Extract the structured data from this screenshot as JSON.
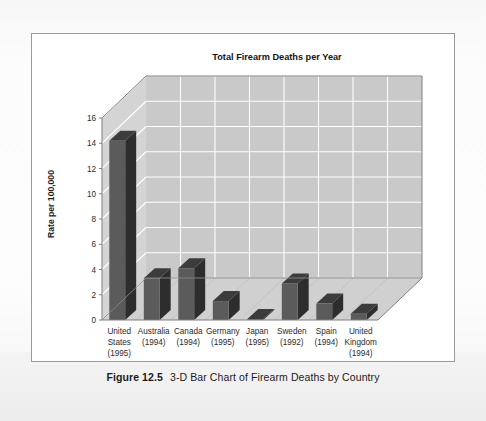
{
  "figure": {
    "caption_label": "Figure 12.5",
    "caption_text": "3-D Bar Chart of Firearm Deaths by Country"
  },
  "colors": {
    "page_background": "#fbfbfb",
    "figure_border": "#9a9a9a",
    "plot_back_wall": "#c9c9c9",
    "plot_side_wall": "#d4d4d4",
    "plot_floor": "#d0d0d0",
    "gridline": "#ffffff",
    "bar_front": "#5b5b5b",
    "bar_side": "#2d2d2d",
    "bar_top": "#3c3c3c",
    "axis_line": "#808080",
    "text": "#2b2b2b"
  },
  "chart_data": {
    "type": "bar",
    "title": "Total Firearm Deaths per Year",
    "xlabel": "",
    "ylabel": "Rate per 100,000",
    "ylim": [
      0,
      16
    ],
    "ytick_step": 2,
    "yticks": [
      "0",
      "2",
      "4",
      "6",
      "8",
      "10",
      "12",
      "14",
      "16"
    ],
    "grid": true,
    "legend": "none",
    "style_3d": true,
    "categories": [
      "United States (1995)",
      "Australia (1994)",
      "Canada (1994)",
      "Germany (1995)",
      "Japan (1995)",
      "Sweden (1992)",
      "Spain (1994)",
      "United Kingdom (1994)"
    ],
    "category_lines": [
      [
        "United",
        "States",
        "(1995)"
      ],
      [
        "Australia",
        "(1994)"
      ],
      [
        "Canada",
        "(1994)"
      ],
      [
        "Germany",
        "(1995)"
      ],
      [
        "Japan",
        "(1995)"
      ],
      [
        "Sweden",
        "(1992)"
      ],
      [
        "Spain",
        "(1994)"
      ],
      [
        "United",
        "Kingdom",
        "(1994)"
      ]
    ],
    "values": [
      14.2,
      3.3,
      4.1,
      1.5,
      0.07,
      2.9,
      1.3,
      0.5
    ]
  }
}
